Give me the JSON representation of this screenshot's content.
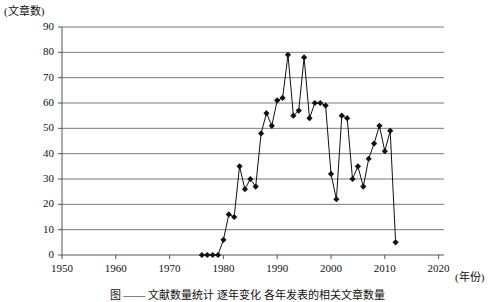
{
  "chart_data": {
    "type": "line",
    "title": "",
    "xlabel": "(年份)",
    "ylabel": "(文章数)",
    "xlim": [
      1950,
      2021
    ],
    "ylim": [
      0,
      90
    ],
    "xticks": [
      1950,
      1960,
      1970,
      1980,
      1990,
      2000,
      2010,
      2020
    ],
    "yticks": [
      0,
      10,
      20,
      30,
      40,
      50,
      60,
      70,
      80,
      90
    ],
    "grid": true,
    "legend": null,
    "marker": "diamond",
    "x": [
      1976,
      1977,
      1978,
      1979,
      1980,
      1981,
      1982,
      1983,
      1984,
      1985,
      1986,
      1987,
      1988,
      1989,
      1990,
      1991,
      1992,
      1993,
      1994,
      1995,
      1996,
      1997,
      1998,
      1999,
      2000,
      2001,
      2002,
      2003,
      2004,
      2005,
      2006,
      2007,
      2008,
      2009,
      2010,
      2011,
      2012
    ],
    "values": [
      0,
      0,
      0,
      0,
      6,
      16,
      15,
      35,
      26,
      30,
      27,
      48,
      56,
      51,
      61,
      62,
      79,
      55,
      57,
      78,
      54,
      60,
      60,
      59,
      32,
      22,
      55,
      54,
      30,
      35,
      27,
      38,
      44,
      51,
      41,
      49,
      5
    ]
  },
  "caption": {
    "text": "图  ——  文献数量统计  逐年变化  各年发表的相关文章数量"
  }
}
